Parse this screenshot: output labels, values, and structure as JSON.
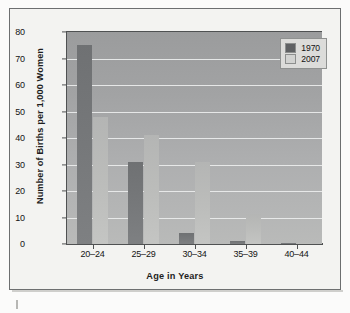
{
  "frame": {
    "border_color": "#6d6f70",
    "background_color": "#f3f3f1"
  },
  "legend": {
    "position": "top-right",
    "entries": [
      {
        "label": "1970",
        "color": "#5f6163",
        "swatch_name": "legend-swatch-1970"
      },
      {
        "label": "2007",
        "color": "#d2d3d1",
        "swatch_name": "legend-swatch-2007"
      }
    ]
  },
  "axes": {
    "y_title": "Number of Births per 1,000 Women",
    "x_title": "Age in Years",
    "y_ticks": [
      "0",
      "10",
      "20",
      "30",
      "40",
      "50",
      "60",
      "70",
      "80"
    ],
    "x_ticks": [
      "20–24",
      "25–29",
      "30–34",
      "35–39",
      "40–44"
    ]
  },
  "chart_data": {
    "type": "bar",
    "title": "",
    "subtitle": "",
    "xlabel": "Age in Years",
    "ylabel": "Number of Births per 1,000 Women",
    "categories": [
      "20–24",
      "25–29",
      "30–34",
      "35–39",
      "40–44"
    ],
    "series": [
      {
        "name": "1970",
        "color": "#76787a",
        "values": [
          75,
          31,
          4,
          1,
          0.3
        ]
      },
      {
        "name": "2007",
        "color": "#bcbdbb",
        "values": [
          48,
          41,
          31,
          11.5,
          0.5
        ]
      }
    ],
    "ylim": [
      0,
      80
    ],
    "ytick_step": 10,
    "grid": true,
    "grid_color": "#eceded",
    "grid_axis": "y",
    "legend_position": "top-right",
    "plot_background": "#a8a9aa",
    "bar_group_count": 5,
    "series_count": 2
  }
}
